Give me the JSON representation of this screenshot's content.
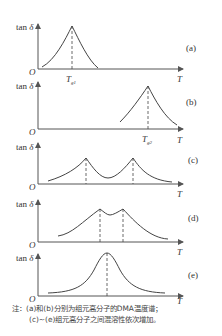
{
  "figure": {
    "y_axis_label": "tan δ",
    "x_axis_label": "T",
    "origin_label": "O",
    "panels": [
      {
        "id": "a",
        "label": "(a)",
        "peaks": [
          "T_g1"
        ],
        "tick_labels": [
          {
            "main": "T",
            "sub": "g1"
          }
        ]
      },
      {
        "id": "b",
        "label": "(b)",
        "peaks": [
          "T_g2"
        ],
        "tick_labels": [
          {
            "main": "T",
            "sub": "g2"
          }
        ]
      },
      {
        "id": "c",
        "label": "(c)",
        "peaks": [
          "two separated peaks"
        ],
        "tick_labels": []
      },
      {
        "id": "d",
        "label": "(d)",
        "peaks": [
          "two close peaks"
        ],
        "tick_labels": []
      },
      {
        "id": "e",
        "label": "(e)",
        "peaks": [
          "single merged peak"
        ],
        "tick_labels": []
      }
    ]
  },
  "note": {
    "line1": "注：(a)和(b)分别为组元高分子的DMA温度谱；",
    "line2": "(c)~(e)组元高分子之间混溶性依次增加。"
  },
  "colors": {
    "line": "#444444",
    "axis": "#555555",
    "text": "#333333"
  }
}
